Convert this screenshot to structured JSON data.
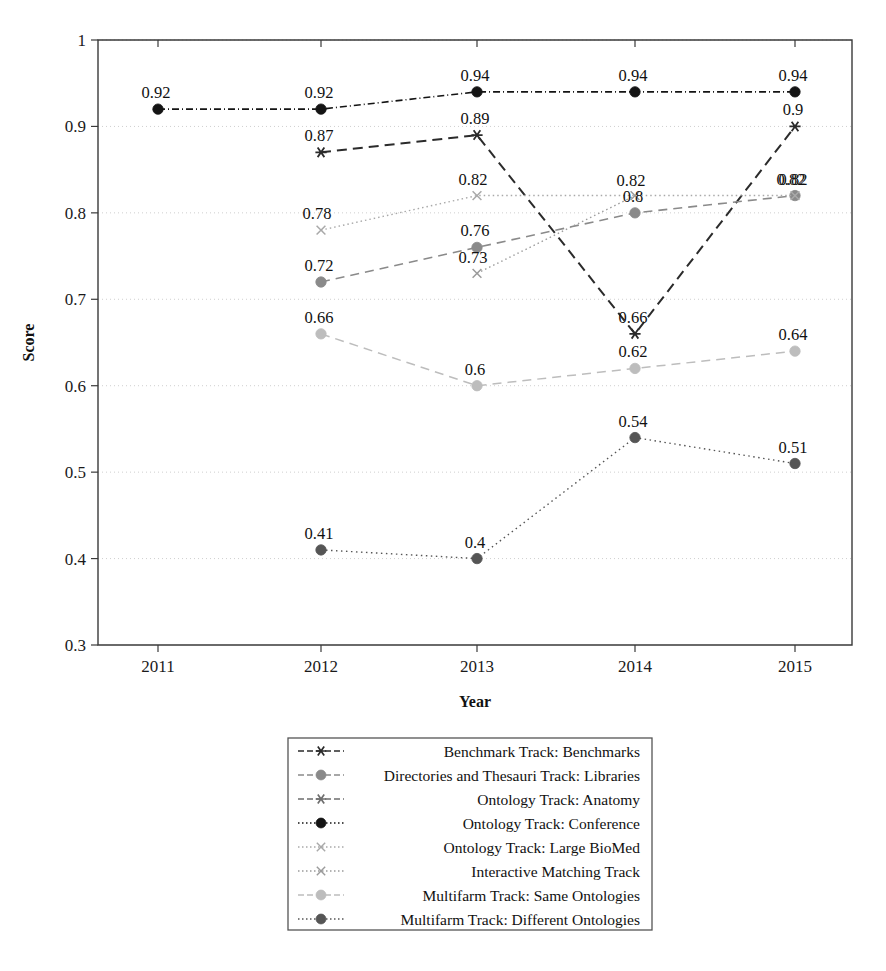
{
  "chart_data": {
    "type": "line",
    "title": "",
    "xlabel": "Year",
    "ylabel": "Score",
    "x": [
      "2011",
      "2012",
      "2013",
      "2014",
      "2015"
    ],
    "xlim": [
      2010.6,
      2015.5
    ],
    "ylim": [
      0.3,
      1.0
    ],
    "yticks": [
      "0.3",
      "0.4",
      "0.5",
      "0.6",
      "0.7",
      "0.8",
      "0.9",
      "1"
    ],
    "ytick_values": [
      0.3,
      0.4,
      0.5,
      0.6,
      0.7,
      0.8,
      0.9,
      1.0
    ],
    "grid": true,
    "legend_position": "below-center",
    "series": [
      {
        "name": "Benchmark Track: Benchmarks",
        "marker": "star",
        "dash": "10 6",
        "color": "#2b2b2b",
        "width": 2.0,
        "points": [
          {
            "x": "2012",
            "y": 0.87,
            "label": "0.87"
          },
          {
            "x": "2013",
            "y": 0.89,
            "label": "0.89"
          },
          {
            "x": "2014",
            "y": 0.66,
            "label": "0.66"
          },
          {
            "x": "2015",
            "y": 0.9,
            "label": "0.9"
          }
        ]
      },
      {
        "name": "Directories and Thesauri Track: Libraries",
        "marker": "circle",
        "dash": "9 6",
        "color": "#8a8a8a",
        "width": 1.6,
        "points": [
          {
            "x": "2012",
            "y": 0.72,
            "label": "0.72"
          },
          {
            "x": "2013",
            "y": 0.76,
            "label": "0.76"
          },
          {
            "x": "2014",
            "y": 0.8,
            "label": "0.8"
          },
          {
            "x": "2015",
            "y": 0.82,
            "label": "0.82"
          }
        ]
      },
      {
        "name": "Ontology Track: Anatomy",
        "marker": "star",
        "dash": "9 5",
        "color": "#6e6e6e",
        "width": 1.5,
        "points": []
      },
      {
        "name": "Ontology Track: Conference",
        "marker": "circle-filled",
        "dash": "7 3 1 3",
        "color": "#141414",
        "width": 1.6,
        "points": [
          {
            "x": "2011",
            "y": 0.92,
            "label": "0.92"
          },
          {
            "x": "2012",
            "y": 0.92,
            "label": "0.92"
          },
          {
            "x": "2013",
            "y": 0.94,
            "label": "0.94"
          },
          {
            "x": "2014",
            "y": 0.94,
            "label": "0.94"
          },
          {
            "x": "2015",
            "y": 0.94,
            "label": "0.94"
          }
        ]
      },
      {
        "name": "Ontology Track: Large BioMed",
        "marker": "x",
        "dash": "1.5 3",
        "color": "#a9a9a9",
        "width": 1.4,
        "points": [
          {
            "x": "2012",
            "y": 0.78,
            "label": "0.78"
          },
          {
            "x": "2013",
            "y": 0.82,
            "label": "0.82"
          },
          {
            "x": "2015",
            "y": 0.82,
            "label": "0.82"
          }
        ]
      },
      {
        "name": "Interactive Matching Track",
        "marker": "x",
        "dash": "1.5 3",
        "color": "#9b9b9b",
        "width": 1.4,
        "points": [
          {
            "x": "2013",
            "y": 0.73,
            "label": "0.73"
          },
          {
            "x": "2014",
            "y": 0.82,
            "label": "0.82"
          }
        ]
      },
      {
        "name": "Multifarm Track: Same Ontologies",
        "marker": "circle",
        "dash": "9 6",
        "color": "#bdbdbd",
        "width": 1.5,
        "points": [
          {
            "x": "2012",
            "y": 0.66,
            "label": "0.66"
          },
          {
            "x": "2013",
            "y": 0.6,
            "label": "0.6"
          },
          {
            "x": "2014",
            "y": 0.62,
            "label": "0.62"
          },
          {
            "x": "2015",
            "y": 0.64,
            "label": "0.64"
          }
        ]
      },
      {
        "name": "Multifarm Track: Different Ontologies",
        "marker": "circle-filled",
        "dash": "1.5 3.5",
        "color": "#555555",
        "width": 1.4,
        "points": [
          {
            "x": "2012",
            "y": 0.41,
            "label": "0.41"
          },
          {
            "x": "2013",
            "y": 0.4,
            "label": "0.4"
          },
          {
            "x": "2014",
            "y": 0.54,
            "label": "0.54"
          },
          {
            "x": "2015",
            "y": 0.51,
            "label": "0.51"
          }
        ]
      }
    ],
    "legend_entries": [
      {
        "label": "Benchmark Track: Benchmarks",
        "marker": "star",
        "dash": "6 3",
        "color": "#2b2b2b"
      },
      {
        "label": "Directories and Thesauri Track: Libraries",
        "marker": "circle",
        "dash": "6 3",
        "color": "#8a8a8a"
      },
      {
        "label": "Ontology Track: Anatomy",
        "marker": "star",
        "dash": "6 3",
        "color": "#6e6e6e"
      },
      {
        "label": "Ontology Track: Conference",
        "marker": "circle-filled",
        "dash": "1.5 2.5",
        "color": "#141414"
      },
      {
        "label": "Ontology Track: Large BioMed",
        "marker": "x",
        "dash": "1.5 2.5",
        "color": "#a9a9a9"
      },
      {
        "label": "Interactive Matching Track",
        "marker": "x",
        "dash": "1.5 2.5",
        "color": "#9b9b9b"
      },
      {
        "label": "Multifarm Track: Same Ontologies",
        "marker": "circle",
        "dash": "6 3",
        "color": "#bdbdbd"
      },
      {
        "label": "Multifarm Track: Different Ontologies",
        "marker": "circle-filled",
        "dash": "1.5 2.5",
        "color": "#555555"
      }
    ]
  },
  "figure": {
    "caption": ""
  }
}
